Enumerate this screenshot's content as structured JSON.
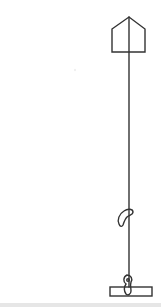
{
  "illustration": {
    "stroke_color": "#333333",
    "background_color": "#ffffff",
    "elements": [
      {
        "name": "pentagon-top",
        "points": [
          [
            112,
            29
          ],
          [
            129,
            17
          ],
          [
            145,
            29
          ],
          [
            145,
            52
          ],
          [
            112,
            52
          ]
        ]
      },
      {
        "name": "vertical-line",
        "x": 129,
        "y1": 17,
        "y2": 295
      },
      {
        "name": "hook-middle",
        "center": [
          125,
          217
        ]
      },
      {
        "name": "hook-bottom",
        "center": [
          129,
          282
        ]
      },
      {
        "name": "base-bar",
        "x": 110,
        "y": 287,
        "width": 42,
        "height": 9
      }
    ]
  },
  "footer_bar_color": "#e6e6e6"
}
